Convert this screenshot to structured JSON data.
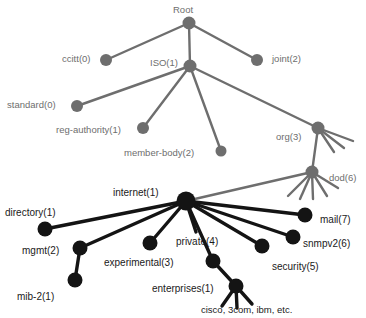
{
  "diagram": {
    "type": "tree-diagram",
    "colors": {
      "upper_tree": "#6e6e6e",
      "lower_tree": "#141414",
      "background": "#ffffff",
      "upper_label": "#6e6e6e",
      "lower_label": "#1a1a1a"
    },
    "nodes": [
      {
        "id": "root",
        "label": "Root",
        "x": 189,
        "y": 23,
        "r": 6.5,
        "tone": "upper",
        "label_x": 173,
        "label_y": 5,
        "label_align": "left"
      },
      {
        "id": "ccitt",
        "label": "ccitt(0)",
        "x": 106,
        "y": 60,
        "r": 6.0,
        "tone": "upper",
        "label_x": 62,
        "label_y": 54,
        "label_align": "left"
      },
      {
        "id": "iso",
        "label": "ISO(1)",
        "x": 190,
        "y": 66,
        "r": 6.5,
        "tone": "upper",
        "label_x": 150,
        "label_y": 58,
        "label_align": "left"
      },
      {
        "id": "joint",
        "label": "joint(2)",
        "x": 257,
        "y": 60,
        "r": 6.0,
        "tone": "upper",
        "label_x": 272,
        "label_y": 54,
        "label_align": "left"
      },
      {
        "id": "standard",
        "label": "standard(0)",
        "x": 77,
        "y": 106,
        "r": 6.0,
        "tone": "upper",
        "label_x": 7,
        "label_y": 100,
        "label_align": "left"
      },
      {
        "id": "reg-authority",
        "label": "reg-authority(1)",
        "x": 143,
        "y": 128,
        "r": 6.0,
        "tone": "upper",
        "label_x": 56,
        "label_y": 125,
        "label_align": "left"
      },
      {
        "id": "member-body",
        "label": "member-body(2)",
        "x": 221,
        "y": 151,
        "r": 5.5,
        "tone": "upper",
        "label_x": 124,
        "label_y": 148,
        "label_align": "left"
      },
      {
        "id": "org",
        "label": "org(3)",
        "x": 318,
        "y": 128,
        "r": 6.5,
        "tone": "upper",
        "label_x": 276,
        "label_y": 132,
        "label_align": "left"
      },
      {
        "id": "dod",
        "label": "dod(6)",
        "x": 312,
        "y": 172,
        "r": 6.5,
        "tone": "upper",
        "label_x": 329,
        "label_y": 173,
        "label_align": "left"
      },
      {
        "id": "internet",
        "label": "internet(1)",
        "x": 186,
        "y": 201,
        "r": 9.5,
        "tone": "lower",
        "label_x": 113,
        "label_y": 188,
        "label_align": "left"
      },
      {
        "id": "directory",
        "label": "directory(1)",
        "x": 45,
        "y": 229,
        "r": 7.5,
        "tone": "lower",
        "label_x": 5,
        "label_y": 208,
        "label_align": "left"
      },
      {
        "id": "mgmt",
        "label": "mgmt(2)",
        "x": 80,
        "y": 248,
        "r": 7.5,
        "tone": "lower",
        "label_x": 22,
        "label_y": 246,
        "label_align": "left"
      },
      {
        "id": "mib-2",
        "label": "mib-2(1)",
        "x": 75,
        "y": 280,
        "r": 7.5,
        "tone": "lower",
        "label_x": 17,
        "label_y": 292,
        "label_align": "left"
      },
      {
        "id": "experimental",
        "label": "experimental(3)",
        "x": 150,
        "y": 243,
        "r": 7.5,
        "tone": "lower",
        "label_x": 104,
        "label_y": 258,
        "label_align": "left"
      },
      {
        "id": "private",
        "label": "private(4)",
        "x": 213,
        "y": 261,
        "r": 7.5,
        "tone": "lower",
        "label_x": 176,
        "label_y": 237,
        "label_align": "left"
      },
      {
        "id": "enterprises",
        "label": "enterprises(1)",
        "x": 236,
        "y": 286,
        "r": 7.5,
        "tone": "lower",
        "label_x": 152,
        "label_y": 284,
        "label_align": "left"
      },
      {
        "id": "security",
        "label": "security(5)",
        "x": 262,
        "y": 246,
        "r": 7.5,
        "tone": "lower",
        "label_x": 272,
        "label_y": 262,
        "label_align": "left"
      },
      {
        "id": "snmpv2",
        "label": "snmpv2(6)",
        "x": 293,
        "y": 237,
        "r": 7.5,
        "tone": "lower",
        "label_x": 303,
        "label_y": 239,
        "label_align": "left"
      },
      {
        "id": "mail",
        "label": "mail(7)",
        "x": 305,
        "y": 215,
        "r": 7.5,
        "tone": "lower",
        "label_x": 320,
        "label_y": 215,
        "label_align": "left"
      }
    ],
    "edges": [
      {
        "from": "root",
        "to": "ccitt",
        "tone": "upper"
      },
      {
        "from": "root",
        "to": "iso",
        "tone": "upper"
      },
      {
        "from": "root",
        "to": "joint",
        "tone": "upper"
      },
      {
        "from": "iso",
        "to": "standard",
        "tone": "upper"
      },
      {
        "from": "iso",
        "to": "reg-authority",
        "tone": "upper"
      },
      {
        "from": "iso",
        "to": "member-body",
        "tone": "upper"
      },
      {
        "from": "iso",
        "to": "org",
        "tone": "upper"
      },
      {
        "from": "org",
        "to": "dod",
        "tone": "upper"
      },
      {
        "from": "dod",
        "to": "internet",
        "tone": "upper"
      },
      {
        "from": "internet",
        "to": "directory",
        "tone": "lower"
      },
      {
        "from": "internet",
        "to": "mgmt",
        "tone": "lower"
      },
      {
        "from": "mgmt",
        "to": "mib-2",
        "tone": "lower"
      },
      {
        "from": "internet",
        "to": "experimental",
        "tone": "lower"
      },
      {
        "from": "internet",
        "to": "private",
        "tone": "lower"
      },
      {
        "from": "private",
        "to": "enterprises",
        "tone": "lower"
      },
      {
        "from": "internet",
        "to": "security",
        "tone": "lower"
      },
      {
        "from": "internet",
        "to": "snmpv2",
        "tone": "lower"
      },
      {
        "from": "internet",
        "to": "mail",
        "tone": "lower"
      }
    ],
    "stub_edges": [
      {
        "parent": "org",
        "tone": "upper",
        "ends": [
          {
            "x": 334,
            "y": 152
          },
          {
            "x": 344,
            "y": 148
          },
          {
            "x": 353,
            "y": 141
          }
        ]
      },
      {
        "parent": "dod",
        "tone": "upper",
        "ends": [
          {
            "x": 288,
            "y": 196
          },
          {
            "x": 300,
            "y": 199
          },
          {
            "x": 313,
            "y": 199
          },
          {
            "x": 327,
            "y": 196
          },
          {
            "x": 338,
            "y": 188
          }
        ]
      },
      {
        "parent": "internet",
        "tone": "lower",
        "ends": [
          {
            "x": 196,
            "y": 232
          }
        ]
      },
      {
        "parent": "enterprises",
        "tone": "lower",
        "ends": [
          {
            "x": 222,
            "y": 306
          },
          {
            "x": 237,
            "y": 308
          },
          {
            "x": 252,
            "y": 304
          }
        ]
      }
    ],
    "annotations": [
      {
        "id": "leaf-vendors",
        "text": "cisco, 3com, ibm, etc.",
        "x": 201,
        "y": 305
      }
    ]
  }
}
